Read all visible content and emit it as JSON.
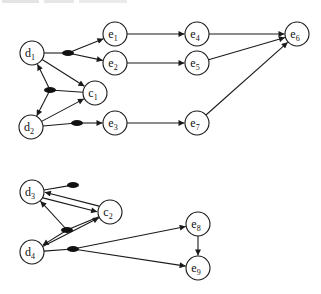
{
  "diagram": {
    "type": "directed-graph",
    "node_radius": 12,
    "stroke_color": "#1a1a1a",
    "fill_color": "#ffffff",
    "nodes": [
      {
        "id": "d1",
        "base": "d",
        "sub": "1",
        "x": 32,
        "y": 53
      },
      {
        "id": "d2",
        "base": "d",
        "sub": "2",
        "x": 31,
        "y": 127
      },
      {
        "id": "c1",
        "base": "c",
        "sub": "1",
        "x": 95,
        "y": 93
      },
      {
        "id": "e1",
        "base": "e",
        "sub": "1",
        "x": 115,
        "y": 34
      },
      {
        "id": "e2",
        "base": "e",
        "sub": "2",
        "x": 115,
        "y": 63
      },
      {
        "id": "e3",
        "base": "e",
        "sub": "3",
        "x": 115,
        "y": 123
      },
      {
        "id": "e4",
        "base": "e",
        "sub": "4",
        "x": 197,
        "y": 34
      },
      {
        "id": "e5",
        "base": "e",
        "sub": "5",
        "x": 197,
        "y": 63
      },
      {
        "id": "e7",
        "base": "e",
        "sub": "7",
        "x": 197,
        "y": 123
      },
      {
        "id": "e6",
        "base": "e",
        "sub": "6",
        "x": 297,
        "y": 34
      },
      {
        "id": "d3",
        "base": "d",
        "sub": "3",
        "x": 32,
        "y": 192
      },
      {
        "id": "d4",
        "base": "d",
        "sub": "4",
        "x": 32,
        "y": 252
      },
      {
        "id": "c2",
        "base": "c",
        "sub": "2",
        "x": 110,
        "y": 212
      },
      {
        "id": "e8",
        "base": "e",
        "sub": "8",
        "x": 198,
        "y": 224
      },
      {
        "id": "e9",
        "base": "e",
        "sub": "9",
        "x": 198,
        "y": 268
      }
    ],
    "junctions": [
      {
        "id": "j1",
        "x": 68,
        "y": 53
      },
      {
        "id": "j2",
        "x": 50,
        "y": 90
      },
      {
        "id": "j3",
        "x": 77,
        "y": 123
      },
      {
        "id": "j4",
        "x": 73,
        "y": 185
      },
      {
        "id": "j5",
        "x": 67,
        "y": 230
      },
      {
        "id": "j6",
        "x": 73,
        "y": 249
      }
    ],
    "edges": [
      {
        "from": "d1",
        "to": "j1",
        "arrow": false
      },
      {
        "from": "j1",
        "to": "e1",
        "arrow": true
      },
      {
        "from": "j1",
        "to": "e2",
        "arrow": true
      },
      {
        "from": "d1",
        "to": "c1",
        "arrow": true
      },
      {
        "from": "c1",
        "to": "j2",
        "arrow": false
      },
      {
        "from": "j2",
        "to": "d1",
        "arrow": true
      },
      {
        "from": "j2",
        "to": "d2",
        "arrow": true
      },
      {
        "from": "d2",
        "to": "c1",
        "arrow": true
      },
      {
        "from": "d2",
        "to": "j3",
        "arrow": false
      },
      {
        "from": "j3",
        "to": "e3",
        "arrow": true
      },
      {
        "from": "e1",
        "to": "e4",
        "arrow": true
      },
      {
        "from": "e2",
        "to": "e5",
        "arrow": true
      },
      {
        "from": "e3",
        "to": "e7",
        "arrow": true
      },
      {
        "from": "e4",
        "to": "e6",
        "arrow": true
      },
      {
        "from": "e5",
        "to": "e6",
        "arrow": true
      },
      {
        "from": "e7",
        "to": "e6",
        "arrow": true
      },
      {
        "from": "d3",
        "to": "j4",
        "arrow": false
      },
      {
        "from": "d3",
        "to": "c2",
        "arrow": true,
        "offset": 3
      },
      {
        "from": "c2",
        "to": "d3",
        "arrow": true,
        "offset": 3
      },
      {
        "from": "c2",
        "to": "j5",
        "arrow": false
      },
      {
        "from": "j5",
        "to": "d3",
        "arrow": true
      },
      {
        "from": "j5",
        "to": "d4",
        "arrow": true
      },
      {
        "from": "d4",
        "to": "c2",
        "arrow": true
      },
      {
        "from": "d4",
        "to": "j6",
        "arrow": false
      },
      {
        "from": "j6",
        "to": "e8",
        "arrow": true
      },
      {
        "from": "j6",
        "to": "e9",
        "arrow": true
      },
      {
        "from": "e8",
        "to": "e9",
        "arrow": true
      }
    ]
  }
}
